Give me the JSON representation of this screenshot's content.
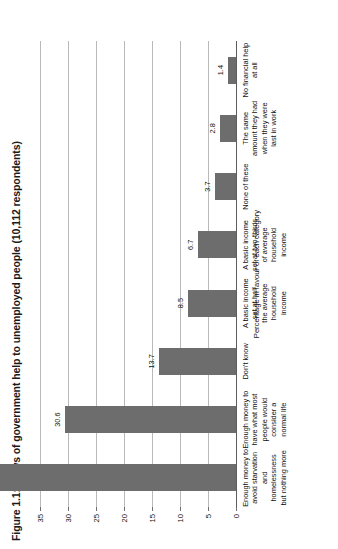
{
  "chart_data": {
    "type": "bar",
    "title": "Figure 1.1: Views of government help to unemployed people (10,112 respondents)",
    "subtitle": "",
    "xlabel": "",
    "ylabel": "Percentage in favour of each category",
    "ylim": [
      0,
      35
    ],
    "ytick_step": 5,
    "grid": true,
    "legend": "none",
    "orientation": "vertical-rotated-page",
    "bar_color": "#6d6d6d",
    "categories": [
      "Enough money to avoid starvation\nand homelessness but nothing more",
      "Enough money to have what most\npeople would consider a normal life",
      "Don't know",
      "A basic income set at half\nthe average household income",
      "A basic income set at two-thirds\nof average household income",
      "None of these",
      "The same amount they had\nwhen they were last in work",
      "No financial help at all"
    ],
    "values": [
      52.6,
      30.6,
      13.7,
      8.5,
      6.7,
      3.7,
      2.8,
      1.4
    ],
    "value_labels": [
      "52.6",
      "30.6",
      "13.7",
      "8.5",
      "6.7",
      "3.7",
      "2.8",
      "1.4"
    ],
    "yticks": [
      0,
      5,
      10,
      15,
      20,
      25,
      30,
      35
    ],
    "ytick_labels": [
      "0",
      "5",
      "10",
      "15",
      "20",
      "25",
      "30",
      "35"
    ]
  }
}
